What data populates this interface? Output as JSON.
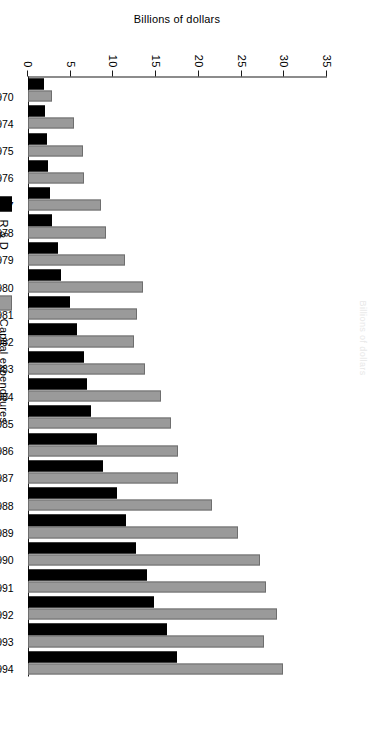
{
  "chart_data": {
    "type": "bar",
    "orientation": "vertical-bars-rendered-sideways",
    "title": "",
    "title_remnant": "Billions of dollars",
    "xlabel": "",
    "ylabel": "Billions of dollars",
    "ylim": [
      0,
      35
    ],
    "yticks": [
      0,
      5,
      10,
      15,
      20,
      25,
      30,
      35
    ],
    "ytick_labels": [
      "0",
      "5",
      "10",
      "15",
      "20",
      "25",
      "30",
      "35"
    ],
    "grid": false,
    "legend_position": "bottom-left",
    "categories": [
      "1970",
      "1974",
      "1975",
      "1976",
      "1977",
      "1978",
      "1979",
      "1980",
      "1981",
      "1982",
      "1983",
      "1984",
      "1985",
      "1986",
      "1987",
      "1988",
      "1989",
      "1990",
      "1991",
      "1992",
      "1993",
      "1994"
    ],
    "series": [
      {
        "name": "R & D",
        "color": "#000000",
        "values": [
          1.9,
          2.0,
          2.2,
          2.4,
          2.6,
          2.8,
          3.5,
          3.9,
          4.9,
          5.7,
          6.6,
          6.9,
          7.4,
          8.1,
          8.8,
          10.4,
          11.5,
          12.7,
          13.9,
          14.8,
          16.3,
          17.4
        ]
      },
      {
        "name": "Capital expenditures",
        "color": "#9a9a9a",
        "values": [
          2.8,
          5.4,
          6.4,
          6.6,
          8.5,
          9.1,
          11.4,
          13.5,
          12.8,
          12.4,
          13.7,
          15.6,
          16.7,
          17.6,
          17.6,
          21.5,
          24.6,
          27.2,
          27.9,
          29.2,
          27.6,
          29.9
        ]
      }
    ]
  },
  "axis": {
    "y_title": "Billions of dollars"
  },
  "legend": {
    "items": [
      {
        "label": "R & D",
        "swatch": "black-square-swatch"
      },
      {
        "label": "Capital expenditures",
        "swatch": "gray-square-swatch"
      }
    ]
  }
}
